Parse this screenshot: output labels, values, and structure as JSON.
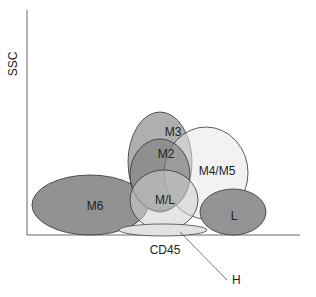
{
  "axes": {
    "y_label": "SSC",
    "x_label": "CD45"
  },
  "populations": [
    {
      "id": "M6",
      "label": "M6",
      "fill": "#8c8c8c"
    },
    {
      "id": "M3",
      "label": "M3",
      "fill": "#a8a8a8"
    },
    {
      "id": "M4M5",
      "label": "M4/M5",
      "fill": "#e6e6e6"
    },
    {
      "id": "M2",
      "label": "M2",
      "fill": "#7a7a7a"
    },
    {
      "id": "ML",
      "label": "M/L",
      "fill": "#c4c4c4"
    },
    {
      "id": "L",
      "label": "L",
      "fill": "#8e8e8e"
    },
    {
      "id": "H",
      "label": "H",
      "fill": "#e0e0e0"
    }
  ],
  "callout": {
    "label": "H"
  },
  "colors": {
    "stroke": "#333333",
    "axis": "#555555"
  }
}
